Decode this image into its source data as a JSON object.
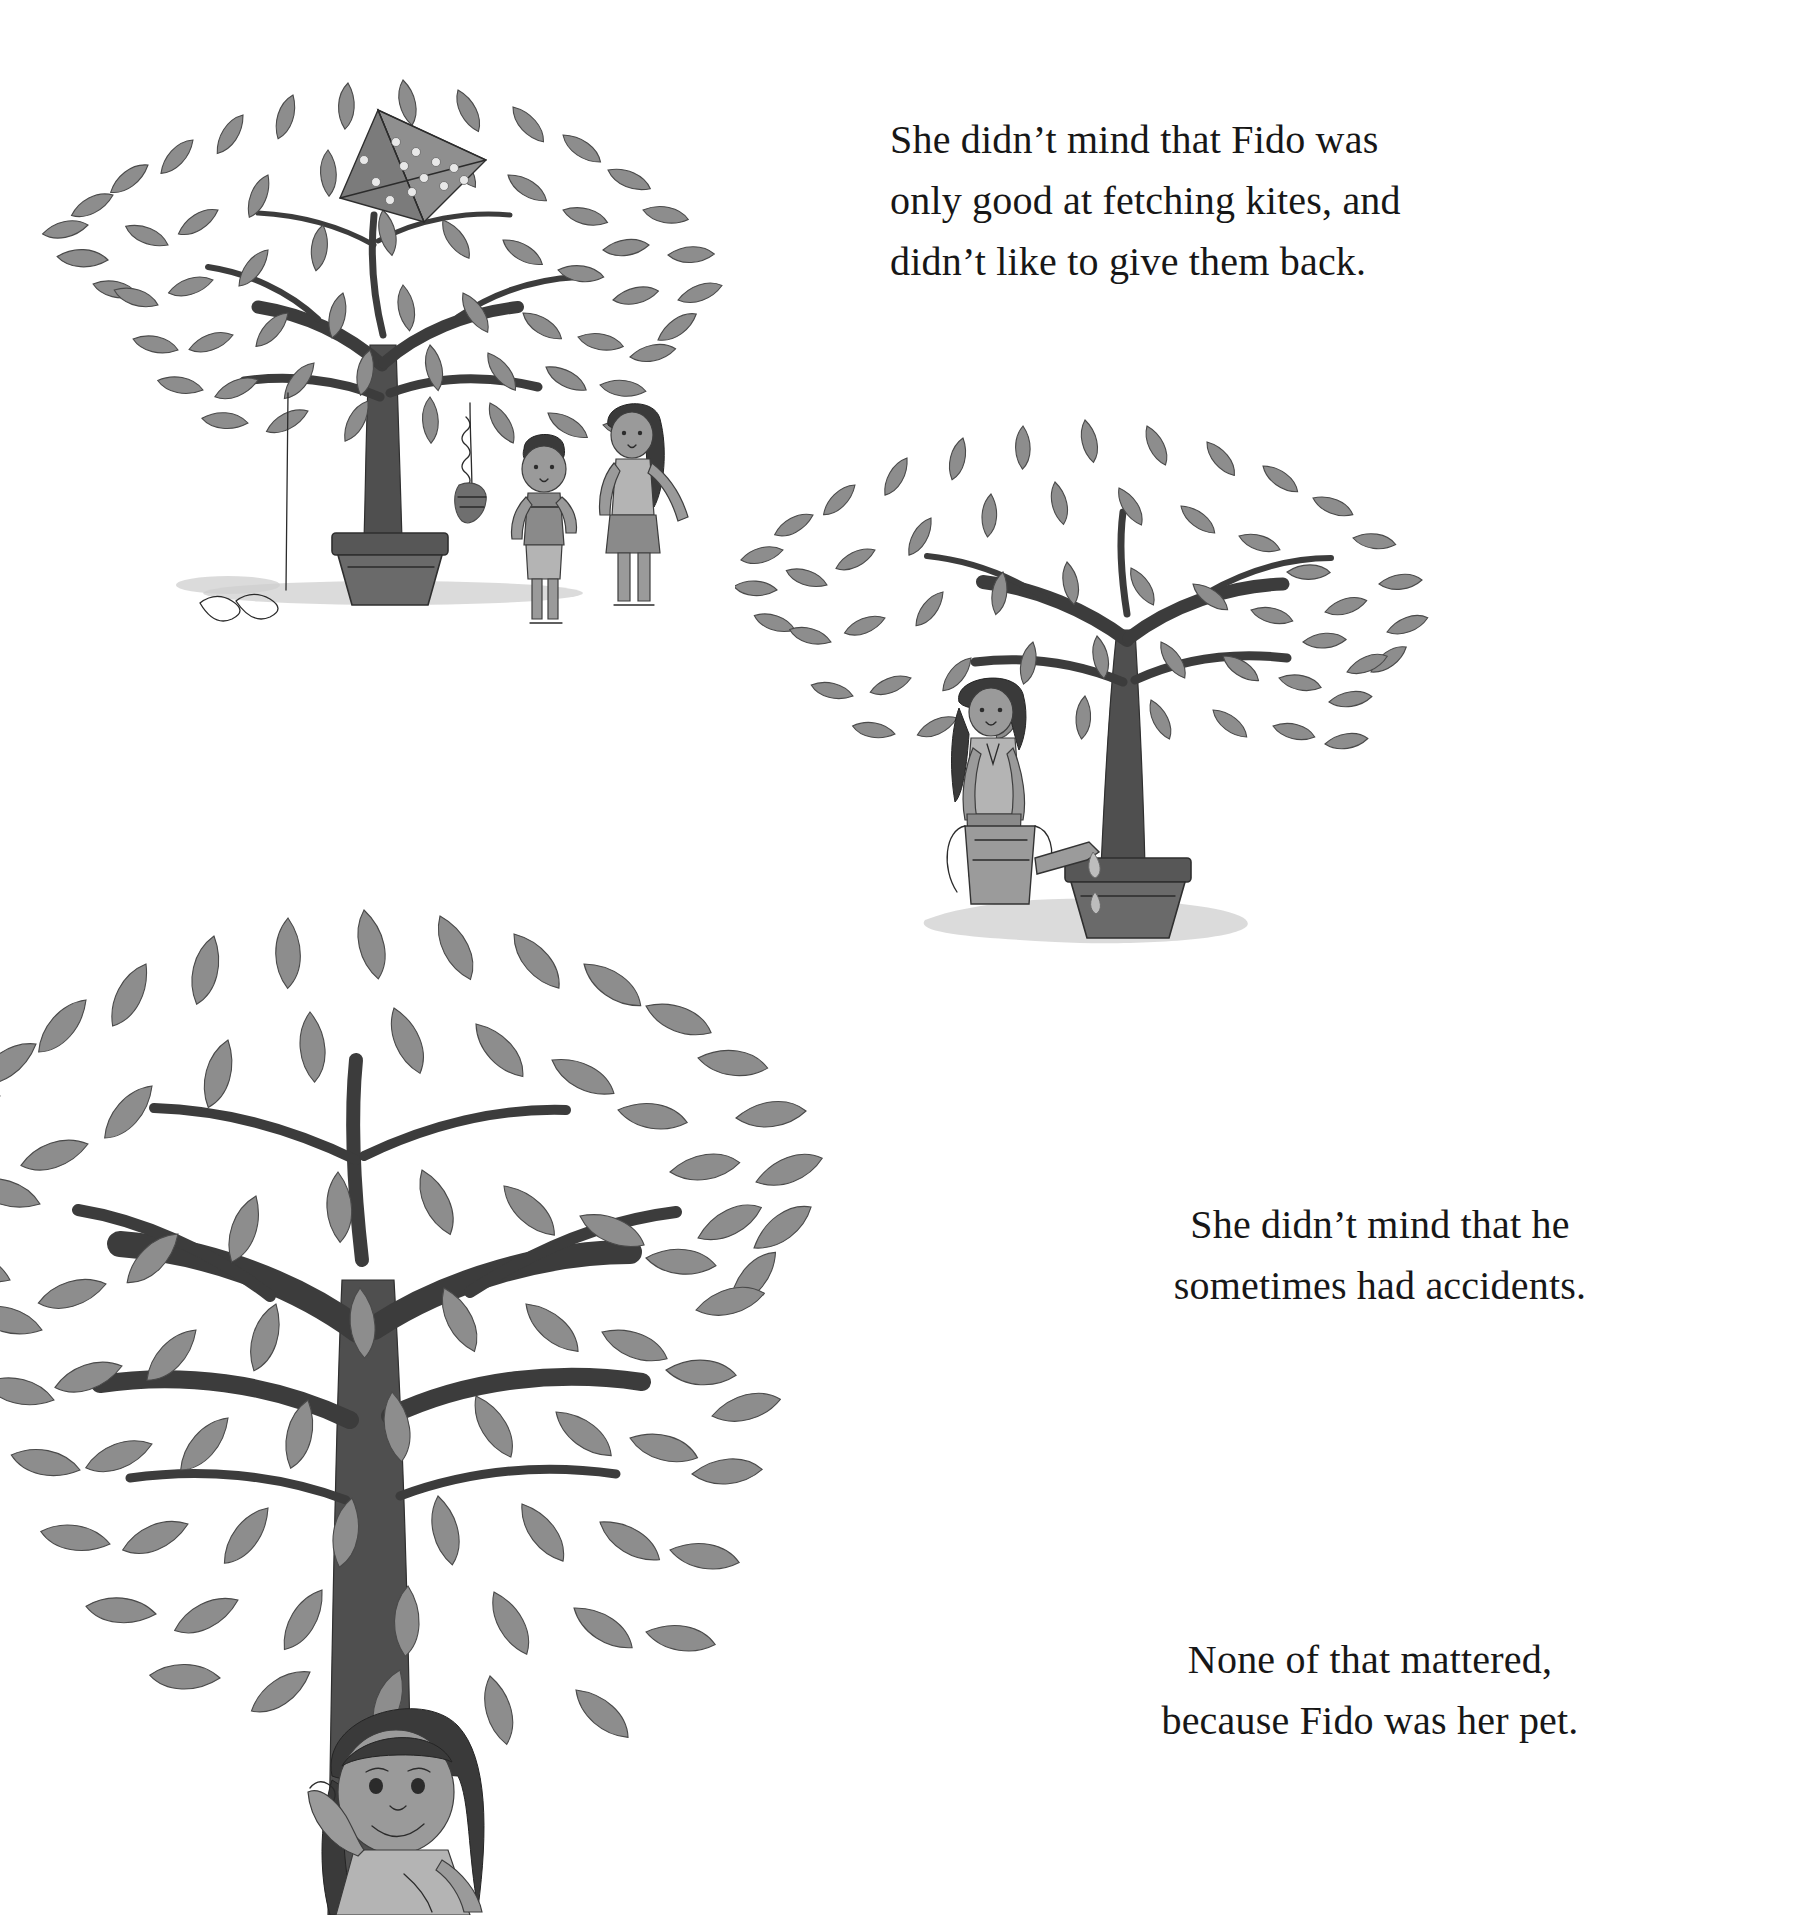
{
  "page": {
    "kind": "picture-book-page",
    "background_color": "#ffffff",
    "ink_color": "#171717"
  },
  "text_blocks": [
    {
      "id": "text-kites",
      "text": "She didn’t mind that Fido was\nonly good at fetching kites, and\ndidn’t like to give them back.",
      "align": "left"
    },
    {
      "id": "text-accidents",
      "text": "She didn’t mind that he\nsometimes had accidents.",
      "align": "center"
    },
    {
      "id": "text-pet",
      "text": "None of that mattered,\nbecause Fido was her pet.",
      "align": "center"
    }
  ],
  "illustrations": [
    {
      "id": "illus-kite-tree",
      "caption_semantic": "potted leafy tree with a polka-dot kite caught in its branches; a boy looks up at the dangling kite tail while a girl in a skirt stands beside him",
      "position": "top-left",
      "elements": [
        "tree",
        "kite",
        "kite-tail",
        "boy",
        "girl",
        "flower-pot",
        "ground-shadow"
      ]
    },
    {
      "id": "illus-water-tree",
      "caption_semantic": "potted leafy tree being watered by a girl with a braid holding a watering can; water drips onto the ground forming a puddle",
      "position": "middle-right",
      "elements": [
        "tree",
        "girl",
        "watering-can",
        "water-drops",
        "flower-pot",
        "puddle"
      ]
    },
    {
      "id": "illus-hug-tree",
      "caption_semantic": "large leafy tree with a long-haired girl smiling and hugging the trunk",
      "position": "bottom-left",
      "elements": [
        "tree",
        "girl",
        "trunk"
      ]
    }
  ]
}
